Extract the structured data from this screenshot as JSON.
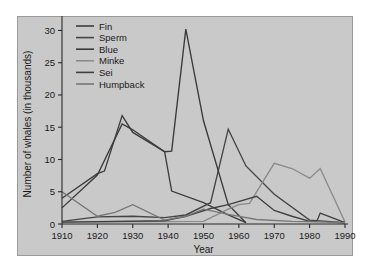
{
  "chart_data": {
    "type": "line",
    "title": "",
    "xlabel": "Year",
    "ylabel": "Number of whales (in thousands)",
    "xlim": [
      1910,
      1990
    ],
    "ylim": [
      0,
      31
    ],
    "grid": false,
    "legend_position": "top-left",
    "xticks": [
      1910,
      1920,
      1930,
      1940,
      1950,
      1960,
      1970,
      1980,
      1990
    ],
    "yticks": [
      0,
      5,
      10,
      15,
      20,
      25,
      30
    ],
    "xtick_labels": [
      "1910",
      "1920",
      "1930",
      "1940",
      "1950",
      "1960",
      "1970",
      "1980",
      "1990"
    ],
    "ytick_labels": [
      "0",
      "5",
      "10",
      "15",
      "20",
      "25",
      "30"
    ],
    "series": [
      {
        "name": "Fin",
        "color": "#3d3d3d",
        "x": [
          1910,
          1920,
          1922,
          1927,
          1930,
          1939,
          1941,
          1950,
          1957,
          1962
        ],
        "y": [
          4.0,
          7.8,
          8.2,
          16.8,
          14.2,
          11.2,
          5.1,
          3.3,
          1.4,
          0.2
        ]
      },
      {
        "name": "Sperm",
        "color": "#444444",
        "x": [
          1910,
          1920,
          1930,
          1939,
          1945,
          1952,
          1957,
          1962,
          1970,
          1980,
          1990
        ],
        "y": [
          0.4,
          1.1,
          1.2,
          1.0,
          1.4,
          3.3,
          14.7,
          9.0,
          4.6,
          0.6,
          0.2
        ]
      },
      {
        "name": "Blue",
        "color": "#3a3a3a",
        "x": [
          1910,
          1920,
          1927,
          1930,
          1939,
          1941,
          1945,
          1950,
          1957,
          1962
        ],
        "y": [
          2.5,
          7.6,
          15.5,
          14.6,
          11.2,
          11.3,
          30.2,
          16.0,
          3.0,
          0.2
        ]
      },
      {
        "name": "Minke",
        "color": "#8a8a8a",
        "x": [
          1910,
          1950,
          1957,
          1960,
          1963,
          1970,
          1975,
          1980,
          1983,
          1990
        ],
        "y": [
          0.3,
          0.4,
          2.3,
          3.0,
          3.2,
          9.4,
          8.6,
          7.1,
          8.6,
          0.3
        ]
      },
      {
        "name": "Sei",
        "color": "#404040",
        "x": [
          1910,
          1939,
          1945,
          1952,
          1957,
          1965,
          1970,
          1975,
          1980,
          1982,
          1983,
          1990
        ],
        "y": [
          0.3,
          0.5,
          1.2,
          2.4,
          3.0,
          4.3,
          2.1,
          1.2,
          0.4,
          0.4,
          1.7,
          0.2
        ]
      },
      {
        "name": "Humpback",
        "color": "#777777",
        "x": [
          1910,
          1920,
          1925,
          1930,
          1939,
          1945,
          1950,
          1957,
          1965,
          1975,
          1985,
          1990
        ],
        "y": [
          5.0,
          1.2,
          1.8,
          3.0,
          0.6,
          1.2,
          2.3,
          1.5,
          0.7,
          0.4,
          0.3,
          0.2
        ]
      }
    ]
  },
  "legend": {
    "items": [
      {
        "label": "Fin"
      },
      {
        "label": "Sperm"
      },
      {
        "label": "Blue"
      },
      {
        "label": "Minke"
      },
      {
        "label": "Sei"
      },
      {
        "label": "Humpback"
      }
    ]
  }
}
